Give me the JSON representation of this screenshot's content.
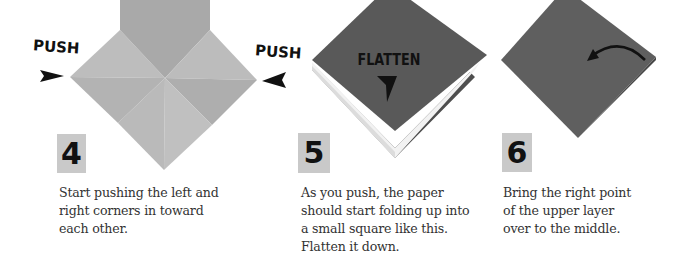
{
  "steps": [
    {
      "number": "4",
      "labels": {
        "left": "PUSH",
        "right": "PUSH"
      },
      "caption": "Start pushing the left and\nright corners in toward\neach other.",
      "illustration": "paper-square-with-creases",
      "paper_color": "#b4b4b4"
    },
    {
      "number": "5",
      "labels": {
        "center": "FLATTEN"
      },
      "caption": "As you push, the paper\nshould start folding up into\na small square like this.\nFlatten it down.",
      "illustration": "folded-square-opening",
      "paper_color": "#5a5a5a"
    },
    {
      "number": "6",
      "caption": "Bring the right point\nof the upper layer\nover to the middle.",
      "illustration": "flat-square-with-curved-arrow",
      "paper_color": "#5e5e5e"
    }
  ],
  "colors": {
    "badge_bg": "#c9c9c9",
    "text": "#333333",
    "arrow": "#111111"
  }
}
